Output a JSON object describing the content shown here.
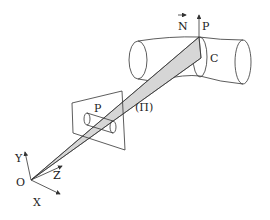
{
  "figure": {
    "labels": {
      "normal": "N",
      "point_large": "P",
      "curve": "C",
      "plane": "(Π)",
      "point_small": "P",
      "origin": "O",
      "axis_x": "X",
      "axis_y": "Y",
      "axis_z": "Z"
    },
    "colors": {
      "line": "#333333",
      "beam_fill": "#d6d6d6",
      "background": "#ffffff"
    }
  }
}
